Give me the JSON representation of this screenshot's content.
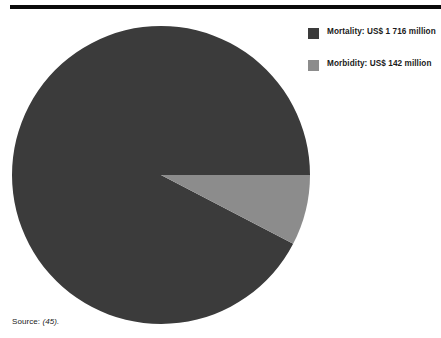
{
  "figure": {
    "source_note_prefix": "Source: ",
    "source_note_ref": "(45)."
  },
  "legend": {
    "position": "right",
    "items": [
      {
        "label": "Mortality:  US$ 1 716 million",
        "color": "#3b3b3b",
        "swatch_name": "mortality-swatch"
      },
      {
        "label": "Morbidity: US$ 142 million",
        "color": "#8c8c8c",
        "swatch_name": "morbidity-swatch"
      }
    ]
  },
  "chart_data": {
    "type": "pie",
    "title": "",
    "subtitle": "",
    "xlabel": "",
    "ylabel": "",
    "unit": "US$ million",
    "grid": false,
    "legend_position": "right",
    "start_angle_deg": 0,
    "direction": "clockwise",
    "labels": [
      "Mortality",
      "Morbidity"
    ],
    "values": [
      1716,
      142
    ],
    "value_labels": [
      "US$ 1 716 million",
      "US$ 142 million"
    ],
    "percentages": [
      92.4,
      7.6
    ],
    "colors": [
      "#3b3b3b",
      "#8c8c8c"
    ],
    "total": 1858,
    "slices": [
      {
        "name": "Mortality",
        "value": 1716,
        "value_label": "US$ 1 716 million",
        "percent": 92.4,
        "color": "#3b3b3b",
        "start_angle_deg": 27.5,
        "end_angle_deg": 360
      },
      {
        "name": "Morbidity",
        "value": 142,
        "value_label": "US$ 142 million",
        "percent": 7.6,
        "color": "#8c8c8c",
        "start_angle_deg": 0,
        "end_angle_deg": 27.5
      }
    ]
  }
}
